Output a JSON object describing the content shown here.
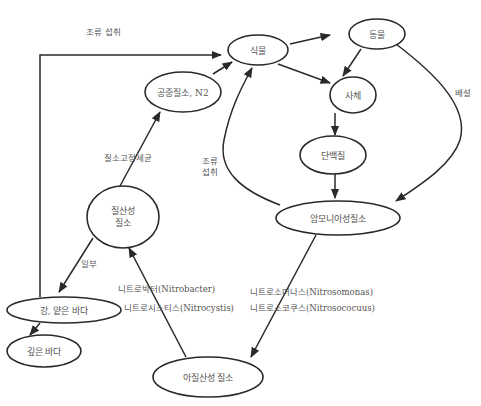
{
  "diagram": {
    "nodes": {
      "plants": {
        "label": "식물"
      },
      "animals": {
        "label": "동물"
      },
      "dead": {
        "label": "사체"
      },
      "protein": {
        "label": "단백질"
      },
      "ammonia_n": {
        "label": "암모니아성질소"
      },
      "atmospheric_n": {
        "label": "공중질소, N2"
      },
      "nitrate_n": {
        "label_line1": "질산성",
        "label_line2": "질소"
      },
      "river_shallow_sea": {
        "label": "강, 얕은 바다"
      },
      "deep_sea": {
        "label": "깊은 바다"
      },
      "nitrite_n": {
        "label": "아질산성 질소"
      }
    },
    "edge_labels": {
      "algae_uptake_top": "조류 섭취",
      "algae_uptake_left_line1": "조류",
      "algae_uptake_left_line2": "섭취",
      "excretion": "배설",
      "nitrogen_fixing_bacteria": "질소고정세균",
      "partial": "일부",
      "nitrobacter": "니트로박터(Nitrobacter)",
      "nitrocystis": "니트로시스티스(Nitrocystis)",
      "nitrosomonas": "니트로소머나스(Nitrosomonas)",
      "nitrosococcus": "니트로소코쿠스(Nitrosococuus)"
    },
    "edges": [
      {
        "from": "river_shallow_sea",
        "to": "plants",
        "label": "조류 섭취"
      },
      {
        "from": "atmospheric_n",
        "to": "plants"
      },
      {
        "from": "plants",
        "to": "animals"
      },
      {
        "from": "plants",
        "to": "dead"
      },
      {
        "from": "animals",
        "to": "dead"
      },
      {
        "from": "animals",
        "to": "ammonia_n",
        "label": "배설"
      },
      {
        "from": "dead",
        "to": "protein"
      },
      {
        "from": "protein",
        "to": "ammonia_n"
      },
      {
        "from": "ammonia_n",
        "to": "plants",
        "label": "조류 섭취"
      },
      {
        "from": "ammonia_n",
        "to": "nitrite_n",
        "label": "니트로소머나스 / 니트로소코쿠스"
      },
      {
        "from": "nitrite_n",
        "to": "nitrate_n",
        "label": "니트로박터 / 니트로시스티스"
      },
      {
        "from": "nitrate_n",
        "to": "atmospheric_n",
        "label": "질소고정세균"
      },
      {
        "from": "nitrate_n",
        "to": "river_shallow_sea",
        "label": "일부"
      },
      {
        "from": "river_shallow_sea",
        "to": "deep_sea"
      }
    ]
  }
}
